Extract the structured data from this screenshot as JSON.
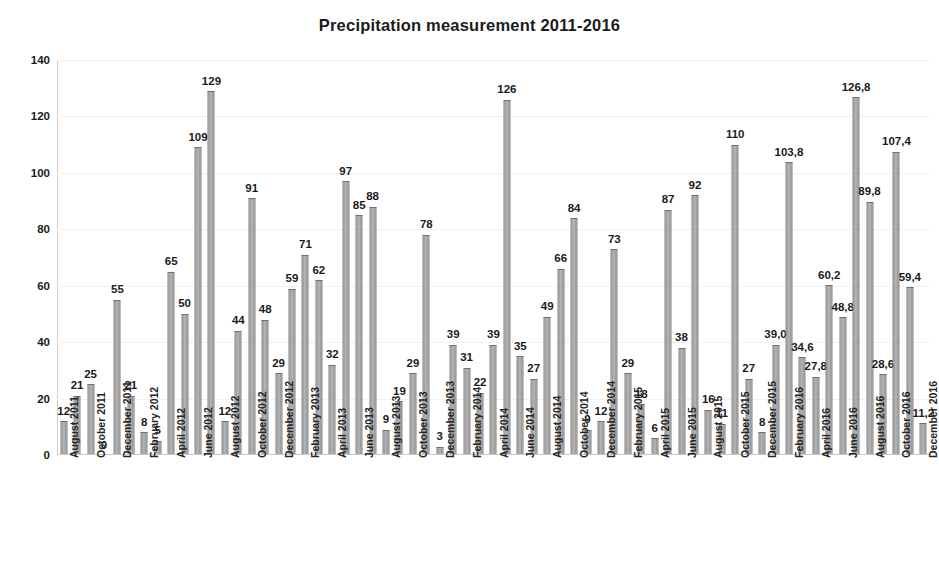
{
  "chart_data": {
    "type": "bar",
    "title": "Precipitation measurement 2011-2016",
    "xlabel": "",
    "ylabel": "",
    "ylim": [
      0,
      140
    ],
    "yticks": [
      0,
      20,
      40,
      60,
      80,
      100,
      120,
      140
    ],
    "grid": true,
    "legend": null,
    "decimal_separator": ",",
    "bar_color": "#a8a8a8",
    "categories": [
      "August 2011",
      "September 2011",
      "October 2011",
      "November 2011",
      "December 2011",
      "January 2012",
      "February 2012",
      "March 2012",
      "April 2012",
      "May 2012",
      "June 2012",
      "July 2012",
      "August 2012",
      "September 2012",
      "October 2012",
      "November 2012",
      "December 2012",
      "January 2013",
      "February 2013",
      "March 2013",
      "April 2013",
      "May 2013",
      "June 2013",
      "July 2013",
      "August 2013",
      "September 2013",
      "October 2013",
      "November 2013",
      "December 2013",
      "January 2014",
      "February 2014",
      "March 2014",
      "April 2014",
      "May 2014",
      "June 2014",
      "July 2014",
      "August 2014",
      "September 2014",
      "October 2014",
      "November 2014",
      "December 2014",
      "January 2015",
      "February 2015",
      "March 2015",
      "April 2015",
      "May 2015",
      "June 2015",
      "July 2015",
      "August 2015",
      "September 2015",
      "October 2015",
      "November 2015",
      "December 2015",
      "January 2016",
      "February 2016",
      "March 2016",
      "April 2016",
      "May 2016",
      "June 2016",
      "July 2016",
      "August 2016",
      "September 2016",
      "October 2016",
      "November 2016",
      "December 2016"
    ],
    "values": [
      12,
      21,
      25,
      0,
      55,
      21,
      8,
      5,
      65,
      50,
      109,
      129,
      12,
      44,
      91,
      48,
      29,
      59,
      71,
      62,
      32,
      97,
      85,
      88,
      9,
      19,
      29,
      78,
      3,
      39,
      31,
      22,
      39,
      126,
      35,
      27,
      49,
      66,
      84,
      9,
      12,
      73,
      29,
      18,
      6,
      87,
      38,
      92,
      16,
      11,
      110,
      27,
      8,
      39.0,
      103.8,
      34.6,
      27.8,
      60.2,
      48.8,
      126.8,
      89.8,
      28.6,
      107.4,
      59.4,
      11.2
    ],
    "value_labels": [
      "12",
      "21",
      "25",
      "0",
      "55",
      "21",
      "8",
      "5",
      "65",
      "50",
      "109",
      "129",
      "12",
      "44",
      "91",
      "48",
      "29",
      "59",
      "71",
      "62",
      "32",
      "97",
      "85",
      "88",
      "9",
      "19",
      "29",
      "78",
      "3",
      "39",
      "31",
      "22",
      "39",
      "126",
      "35",
      "27",
      "49",
      "66",
      "84",
      "9",
      "12",
      "73",
      "29",
      "18",
      "6",
      "87",
      "38",
      "92",
      "16",
      "11",
      "110",
      "27",
      "8",
      "39,0",
      "103,8",
      "34,6",
      "27,8",
      "60,2",
      "48,8",
      "126,8",
      "89,8",
      "28,6",
      "107,4",
      "59,4",
      "11,2"
    ],
    "xtick_labels": [
      "August 2011",
      "October 2011",
      "December 2011",
      "February 2012",
      "April 2012",
      "June 2012",
      "August 2012",
      "October 2012",
      "December 2012",
      "February 2013",
      "April 2013",
      "June 2013",
      "August 2013",
      "October 2013",
      "December 2013",
      "February 2014",
      "April 2014",
      "June 2014",
      "August 2014",
      "October 2014",
      "December 2014",
      "February 2015",
      "April 2015",
      "June 2015",
      "August 2015",
      "October 2015",
      "December 2015",
      "February 2016",
      "April 2016",
      "June 2016",
      "August 2016",
      "October 2016",
      "December 2016"
    ],
    "xtick_indices": [
      0,
      2,
      4,
      6,
      8,
      10,
      12,
      14,
      16,
      18,
      20,
      22,
      24,
      26,
      28,
      30,
      32,
      34,
      36,
      38,
      40,
      42,
      44,
      46,
      48,
      50,
      52,
      54,
      56,
      58,
      60,
      62,
      64
    ]
  }
}
